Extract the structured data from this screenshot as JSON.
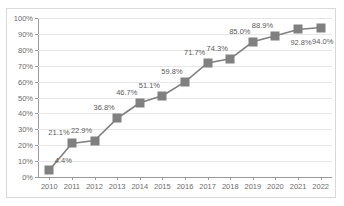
{
  "chart_data": {
    "type": "line",
    "title": "",
    "subtitle": "",
    "xlabel": "",
    "ylabel": "",
    "categories": [
      "2010",
      "2011",
      "2012",
      "2013",
      "2014",
      "2015",
      "2016",
      "2017",
      "2018",
      "2019",
      "2020",
      "2021",
      "2022"
    ],
    "values": [
      4.4,
      21.1,
      22.9,
      36.8,
      46.7,
      51.1,
      59.8,
      71.7,
      74.3,
      85.0,
      88.9,
      92.8,
      94.0
    ],
    "data_labels": [
      "4.4%",
      "21.1%",
      "22.9%",
      "36.8%",
      "46.7%",
      "51.1%",
      "59.8%",
      "71.7%",
      "74.3%",
      "85.0%",
      "88.9%",
      "92.8%",
      "94.0%"
    ],
    "ylim": [
      0,
      100
    ],
    "ytick_labels": [
      "0%",
      "10%",
      "20%",
      "30%",
      "40%",
      "50%",
      "60%",
      "70%",
      "80%",
      "90%",
      "100%"
    ],
    "ytick_values": [
      0,
      10,
      20,
      30,
      40,
      50,
      60,
      70,
      80,
      90,
      100
    ],
    "grid": true,
    "legend": "none",
    "series_color": "#808080",
    "grid_color": "#e6e6e6",
    "axis_color": "#9a9a9a",
    "label_color": "#5a5a5a",
    "marker": "square"
  }
}
